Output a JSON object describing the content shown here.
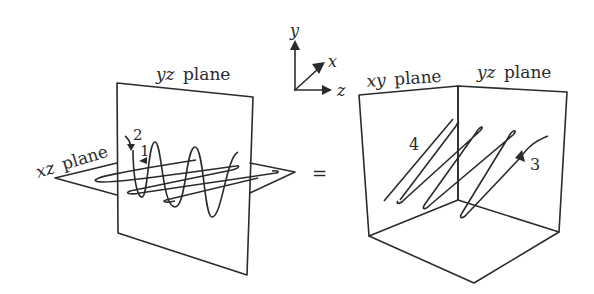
{
  "figure": {
    "left": {
      "planes": [
        {
          "name": "yz",
          "italic": "yz",
          "label": "plane"
        },
        {
          "name": "xz",
          "italic": "xz",
          "label": "plane"
        }
      ],
      "markers": [
        "1",
        "2"
      ]
    },
    "operator": "=",
    "axes": {
      "y": "y",
      "x": "x",
      "z": "z"
    },
    "right": {
      "planes": [
        {
          "name": "xy",
          "italic": "xy",
          "label": "plane"
        },
        {
          "name": "yz",
          "italic": "yz",
          "label": "plane"
        }
      ],
      "markers": [
        "4",
        "3"
      ]
    },
    "colors": {
      "ink": "#2b2b2b",
      "background": "#ffffff"
    }
  }
}
